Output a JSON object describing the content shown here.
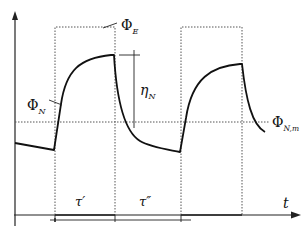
{
  "diagram": {
    "type": "waveform",
    "colors": {
      "curve": "#111111",
      "dotted": "#555555",
      "axis": "#222222",
      "background": "#ffffff"
    },
    "labels": {
      "phi_e": {
        "symbol": "Φ",
        "sub": "E"
      },
      "phi_n": {
        "symbol": "Φ",
        "sub": "N"
      },
      "phi_nm": {
        "symbol": "Φ",
        "sub": "N,m"
      },
      "eta_n": {
        "symbol": "η",
        "sub": "N"
      },
      "tau_prime": "τ′",
      "tau_double_prime": "τ″",
      "t_axis": "t"
    }
  }
}
